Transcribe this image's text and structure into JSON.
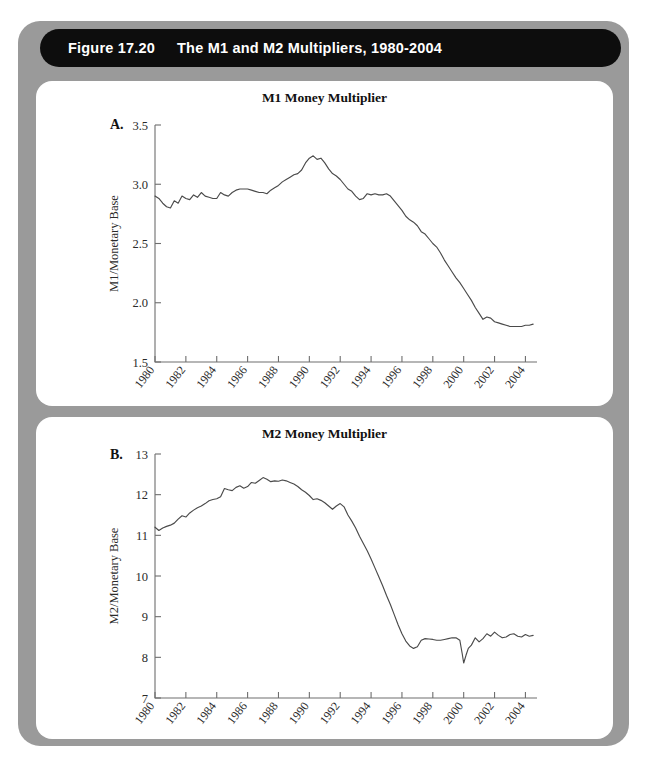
{
  "figure": {
    "number": "Figure 17.20",
    "title": "The M1 and M2 Multipliers, 1980-2004",
    "frame_color": "#9a9a9a",
    "title_bar_color": "#0d0d0d",
    "panel_color": "#ffffff"
  },
  "panels": [
    {
      "letter": "A.",
      "title": "M1 Money Multiplier"
    },
    {
      "letter": "B.",
      "title": "M2 Money Multiplier"
    }
  ],
  "chart_data": [
    {
      "type": "line",
      "panel": "A.",
      "title": "M1 Money Multiplier",
      "xlabel": "",
      "ylabel": "M1/Monetary Base",
      "xlim": [
        1980,
        2004.75
      ],
      "ylim": [
        1.5,
        3.5
      ],
      "yticks": [
        1.5,
        2.0,
        2.5,
        3.0,
        3.5
      ],
      "ytick_labels": [
        "1.5",
        "2.0",
        "2.5",
        "3.0",
        "3.5"
      ],
      "xticks": [
        1980,
        1982,
        1984,
        1986,
        1988,
        1990,
        1992,
        1994,
        1996,
        1998,
        2000,
        2002,
        2004
      ],
      "xtick_labels": [
        "1980",
        "1982",
        "1984",
        "1986",
        "1988",
        "1990",
        "1992",
        "1994",
        "1996",
        "1998",
        "2000",
        "2002",
        "2004"
      ],
      "grid": false,
      "legend": "none",
      "line_color": "#4a4a4a",
      "series": [
        {
          "name": "M1/Monetary Base",
          "x": [
            1980.0,
            1980.25,
            1980.5,
            1980.75,
            1981.0,
            1981.25,
            1981.5,
            1981.75,
            1982.0,
            1982.25,
            1982.5,
            1982.75,
            1983.0,
            1983.25,
            1983.5,
            1983.75,
            1984.0,
            1984.25,
            1984.5,
            1984.75,
            1985.0,
            1985.25,
            1985.5,
            1985.75,
            1986.0,
            1986.25,
            1986.5,
            1986.75,
            1987.0,
            1987.25,
            1987.5,
            1987.75,
            1988.0,
            1988.25,
            1988.5,
            1988.75,
            1989.0,
            1989.25,
            1989.5,
            1989.75,
            1990.0,
            1990.25,
            1990.5,
            1990.75,
            1991.0,
            1991.25,
            1991.5,
            1991.75,
            1992.0,
            1992.25,
            1992.5,
            1992.75,
            1993.0,
            1993.25,
            1993.5,
            1993.75,
            1994.0,
            1994.25,
            1994.5,
            1994.75,
            1995.0,
            1995.25,
            1995.5,
            1995.75,
            1996.0,
            1996.25,
            1996.5,
            1996.75,
            1997.0,
            1997.25,
            1997.5,
            1997.75,
            1998.0,
            1998.25,
            1998.5,
            1998.75,
            1999.0,
            1999.25,
            1999.5,
            1999.75,
            2000.0,
            2000.25,
            2000.5,
            2000.75,
            2001.0,
            2001.25,
            2001.5,
            2001.75,
            2002.0,
            2002.25,
            2002.5,
            2002.75,
            2003.0,
            2003.25,
            2003.5,
            2003.75,
            2004.0,
            2004.25,
            2004.5
          ],
          "y": [
            2.9,
            2.88,
            2.84,
            2.81,
            2.8,
            2.86,
            2.84,
            2.9,
            2.88,
            2.87,
            2.91,
            2.89,
            2.93,
            2.9,
            2.89,
            2.88,
            2.88,
            2.93,
            2.91,
            2.9,
            2.93,
            2.95,
            2.96,
            2.96,
            2.96,
            2.95,
            2.94,
            2.93,
            2.93,
            2.92,
            2.95,
            2.97,
            2.99,
            3.02,
            3.04,
            3.06,
            3.08,
            3.09,
            3.12,
            3.18,
            3.22,
            3.24,
            3.21,
            3.22,
            3.18,
            3.13,
            3.09,
            3.07,
            3.04,
            3.0,
            2.96,
            2.94,
            2.9,
            2.87,
            2.88,
            2.92,
            2.91,
            2.92,
            2.91,
            2.91,
            2.92,
            2.9,
            2.86,
            2.82,
            2.78,
            2.73,
            2.7,
            2.68,
            2.65,
            2.6,
            2.58,
            2.54,
            2.5,
            2.47,
            2.42,
            2.36,
            2.31,
            2.26,
            2.21,
            2.17,
            2.12,
            2.07,
            2.02,
            1.96,
            1.91,
            1.86,
            1.88,
            1.87,
            1.84,
            1.83,
            1.82,
            1.81,
            1.8,
            1.8,
            1.8,
            1.8,
            1.81,
            1.81,
            1.82
          ]
        }
      ]
    },
    {
      "type": "line",
      "panel": "B.",
      "title": "M2 Money Multiplier",
      "xlabel": "",
      "ylabel": "M2/Monetary Base",
      "xlim": [
        1980,
        2004.75
      ],
      "ylim": [
        7,
        13
      ],
      "yticks": [
        7,
        8,
        9,
        10,
        11,
        12,
        13
      ],
      "ytick_labels": [
        "7",
        "8",
        "9",
        "10",
        "11",
        "12",
        "13"
      ],
      "xticks": [
        1980,
        1982,
        1984,
        1986,
        1988,
        1990,
        1992,
        1994,
        1996,
        1998,
        2000,
        2002,
        2004
      ],
      "xtick_labels": [
        "1980",
        "1982",
        "1984",
        "1986",
        "1988",
        "1990",
        "1992",
        "1994",
        "1996",
        "1998",
        "2000",
        "2002",
        "2004"
      ],
      "grid": false,
      "legend": "none",
      "line_color": "#4a4a4a",
      "series": [
        {
          "name": "M2/Monetary Base",
          "x": [
            1980.0,
            1980.25,
            1980.5,
            1980.75,
            1981.0,
            1981.25,
            1981.5,
            1981.75,
            1982.0,
            1982.25,
            1982.5,
            1982.75,
            1983.0,
            1983.25,
            1983.5,
            1983.75,
            1984.0,
            1984.25,
            1984.5,
            1984.75,
            1985.0,
            1985.25,
            1985.5,
            1985.75,
            1986.0,
            1986.25,
            1986.5,
            1986.75,
            1987.0,
            1987.25,
            1987.5,
            1987.75,
            1988.0,
            1988.25,
            1988.5,
            1988.75,
            1989.0,
            1989.25,
            1989.5,
            1989.75,
            1990.0,
            1990.25,
            1990.5,
            1990.75,
            1991.0,
            1991.25,
            1991.5,
            1991.75,
            1992.0,
            1992.25,
            1992.5,
            1992.75,
            1993.0,
            1993.25,
            1993.5,
            1993.75,
            1994.0,
            1994.25,
            1994.5,
            1994.75,
            1995.0,
            1995.25,
            1995.5,
            1995.75,
            1996.0,
            1996.25,
            1996.5,
            1996.75,
            1997.0,
            1997.25,
            1997.5,
            1997.75,
            1998.0,
            1998.25,
            1998.5,
            1998.75,
            1999.0,
            1999.25,
            1999.5,
            1999.75,
            1999.9,
            2000.0,
            2000.15,
            2000.3,
            2000.5,
            2000.75,
            2001.0,
            2001.25,
            2001.5,
            2001.75,
            2002.0,
            2002.25,
            2002.5,
            2002.75,
            2003.0,
            2003.25,
            2003.5,
            2003.75,
            2004.0,
            2004.25,
            2004.5
          ],
          "y": [
            11.2,
            11.12,
            11.18,
            11.22,
            11.25,
            11.3,
            11.4,
            11.48,
            11.45,
            11.55,
            11.62,
            11.68,
            11.72,
            11.78,
            11.85,
            11.88,
            11.9,
            11.95,
            12.15,
            12.12,
            12.1,
            12.18,
            12.22,
            12.16,
            12.2,
            12.3,
            12.28,
            12.35,
            12.42,
            12.38,
            12.32,
            12.34,
            12.33,
            12.36,
            12.34,
            12.3,
            12.26,
            12.2,
            12.12,
            12.06,
            11.98,
            11.88,
            11.9,
            11.86,
            11.8,
            11.72,
            11.64,
            11.72,
            11.78,
            11.7,
            11.5,
            11.35,
            11.18,
            10.98,
            10.8,
            10.62,
            10.42,
            10.2,
            9.98,
            9.76,
            9.52,
            9.3,
            9.05,
            8.8,
            8.58,
            8.4,
            8.28,
            8.22,
            8.26,
            8.42,
            8.46,
            8.45,
            8.44,
            8.42,
            8.42,
            8.44,
            8.46,
            8.48,
            8.48,
            8.42,
            8.1,
            7.86,
            8.05,
            8.22,
            8.3,
            8.48,
            8.38,
            8.46,
            8.58,
            8.52,
            8.62,
            8.54,
            8.48,
            8.5,
            8.56,
            8.58,
            8.52,
            8.5,
            8.56,
            8.52,
            8.54
          ]
        }
      ]
    }
  ]
}
